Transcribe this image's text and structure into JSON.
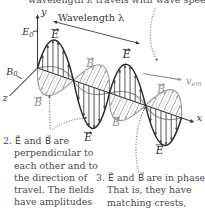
{
  "top_caption": {
    "prefix": "wavelength λ travels with wave speed ",
    "speed_main": "v",
    "speed_sub": "em",
    "suffix": "."
  },
  "diagram": {
    "wavelength_label": "Wavelength λ",
    "axis": {
      "x": "x",
      "y": "y",
      "z": "z"
    },
    "amplitudes": {
      "E_main": "E",
      "E_sub": "0",
      "B_main": "B",
      "B_sub": "0"
    },
    "speed": {
      "main": "v",
      "sub": "em"
    },
    "e_label": "E",
    "b_label": "B",
    "colors": {
      "e_field": "#2a2a2a",
      "e_arrows": "#4f4f4f",
      "b_field": "#9a9a9a",
      "b_arrows": "#a3a3a3",
      "hatch": "#bdbdbd",
      "axis": "#3a3a3a",
      "annotation": "#4c4c4c",
      "e_label": "#222222",
      "b_label": "#8d8d8d",
      "text": "#4a4a4a"
    }
  },
  "notes": {
    "note2": [
      "2. E⃗ and B⃗ are",
      "perpendicular to",
      "each other and to",
      "the direction of",
      "travel. The fields",
      "have amplitudes"
    ],
    "note3": [
      "3. E⃗ and B⃗ are in phase.",
      "That is, they have",
      "matching crests,"
    ]
  }
}
